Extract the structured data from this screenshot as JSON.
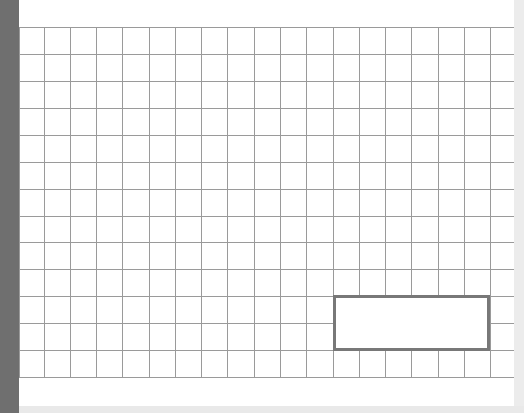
{
  "canvas": {
    "background": "#ffffff",
    "grid": {
      "line_color": "#9a9a9a",
      "vertical_lines_x": [
        19,
        44,
        70,
        96,
        122,
        149,
        175,
        201,
        227,
        254,
        280,
        306,
        333,
        359,
        385,
        411,
        438,
        464,
        490
      ],
      "horizontal_lines_y": [
        27,
        54,
        81,
        108,
        135,
        162,
        189,
        216,
        242,
        269,
        296,
        323,
        350,
        377
      ],
      "left": 19,
      "right": 514,
      "top": 27,
      "bottom": 377
    },
    "selection_rectangle": {
      "x": 333,
      "y": 295,
      "width": 157,
      "height": 56,
      "border_color": "#787878"
    }
  },
  "chrome": {
    "left_bar_color": "#6f6f6f",
    "right_bar_color": "#ececec",
    "bottom_bar_color": "#e9e9e9"
  }
}
